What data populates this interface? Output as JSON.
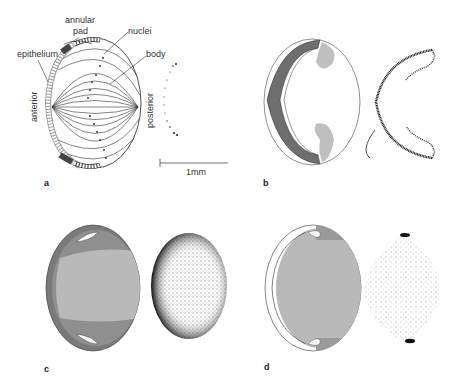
{
  "figure": {
    "panels": [
      {
        "id": "a",
        "letter": "a"
      },
      {
        "id": "b",
        "letter": "b"
      },
      {
        "id": "c",
        "letter": "c"
      },
      {
        "id": "d",
        "letter": "d"
      }
    ],
    "panel_a": {
      "labels": {
        "annular_pad": "annular",
        "annular_pad_2": "pad",
        "nuclei": "nuclei",
        "epithelium": "epithelium",
        "body": "body",
        "anterior": "anterior",
        "posterior": "posterior"
      },
      "scale_bar": "1mm"
    },
    "colors": {
      "dark_gray": "#6e6e6e",
      "mid_gray": "#8f8f8f",
      "light_gray": "#b9b9b9",
      "pale_gray": "#cfcfcf",
      "ink": "#222222"
    }
  }
}
